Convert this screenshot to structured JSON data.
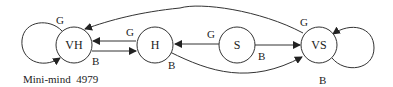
{
  "caption": "Mini-mind  4979",
  "nodes": {
    "vh": {
      "label": "VH"
    },
    "h": {
      "label": "H"
    },
    "s": {
      "label": "S"
    },
    "vs": {
      "label": "VS"
    }
  },
  "edges": {
    "vh_self": {
      "from": "VH",
      "to": "VH",
      "label": "G"
    },
    "vh_to_h": {
      "from": "VH",
      "to": "H",
      "label": "B"
    },
    "h_to_vh": {
      "from": "H",
      "to": "VH",
      "label": "G"
    },
    "s_to_h": {
      "from": "S",
      "to": "H",
      "label": "G"
    },
    "s_to_vs": {
      "from": "S",
      "to": "VS",
      "label": "B"
    },
    "h_to_vs": {
      "from": "H",
      "to": "VS",
      "label": "B"
    },
    "vs_to_vh": {
      "from": "VS",
      "to": "VH",
      "label": "G"
    },
    "vs_self": {
      "from": "VS",
      "to": "VS",
      "label": "B"
    }
  },
  "colors": {
    "stroke": "#333333",
    "text": "#222222",
    "background": "#ffffff"
  }
}
